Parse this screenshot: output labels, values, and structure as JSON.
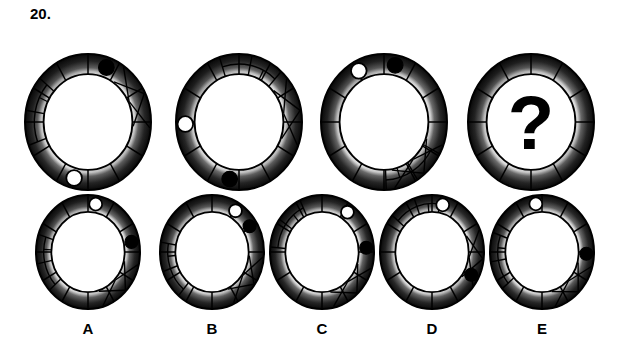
{
  "question": {
    "number": "20.",
    "type": "abstract-reasoning-matrix",
    "missing_marker": "?"
  },
  "palette": {
    "background": "#ffffff",
    "ink": "#000000",
    "ring_dark": "#0b0b0b",
    "ring_mid": "#6e6e6e",
    "ring_light": "#f2f2f2",
    "dot_black": "#000000",
    "dot_white": "#ffffff"
  },
  "sequence": {
    "label": "top-row-sequence",
    "items": [
      {
        "id": "seq-1",
        "position": 1,
        "spokes": 12,
        "black_dot_deg": -70,
        "white_dot_deg": 105,
        "zigzag_deg": -40,
        "ladder_deg": 190,
        "has_question": false,
        "cx": 88,
        "cy": 100,
        "rx": 63,
        "ry": 68
      },
      {
        "id": "seq-2",
        "position": 2,
        "spokes": 12,
        "black_dot_deg": 100,
        "white_dot_deg": 178,
        "zigzag_deg": -25,
        "ladder_deg": -78,
        "has_question": false,
        "cx": 239,
        "cy": 100,
        "rx": 63,
        "ry": 68
      },
      {
        "id": "seq-3",
        "position": 3,
        "spokes": 12,
        "black_dot_deg": -78,
        "white_dot_deg": -118,
        "zigzag_deg": 35,
        "ladder_deg": 58,
        "has_question": false,
        "cx": 384,
        "cy": 100,
        "rx": 63,
        "ry": 68
      },
      {
        "id": "seq-4",
        "position": 4,
        "spokes": 12,
        "black_dot_deg": null,
        "white_dot_deg": null,
        "zigzag_deg": null,
        "ladder_deg": null,
        "has_question": true,
        "cx": 531,
        "cy": 100,
        "rx": 63,
        "ry": 68
      }
    ]
  },
  "options": {
    "label": "answer-options",
    "items": [
      {
        "id": "option-a",
        "letter": "A",
        "spokes": 12,
        "black_dot_deg": -12,
        "white_dot_deg": -80,
        "zigzag_deg": 28,
        "ladder_deg": 168,
        "has_question": false,
        "cx": 88,
        "cy": 62,
        "rx": 52,
        "ry": 57,
        "label_x": 88,
        "label_y": 130
      },
      {
        "id": "option-b",
        "letter": "B",
        "spokes": 12,
        "black_dot_deg": -32,
        "white_dot_deg": -58,
        "zigzag_deg": 20,
        "ladder_deg": 160,
        "has_question": false,
        "cx": 212,
        "cy": 62,
        "rx": 52,
        "ry": 57,
        "label_x": 212,
        "label_y": 130
      },
      {
        "id": "option-c",
        "letter": "C",
        "spokes": 12,
        "black_dot_deg": -5,
        "white_dot_deg": -55,
        "zigzag_deg": 32,
        "ladder_deg": -145,
        "has_question": false,
        "cx": 322,
        "cy": 62,
        "rx": 52,
        "ry": 57,
        "label_x": 322,
        "label_y": 130
      },
      {
        "id": "option-d",
        "letter": "D",
        "spokes": 12,
        "black_dot_deg": 28,
        "white_dot_deg": -76,
        "zigzag_deg": -8,
        "ladder_deg": -110,
        "has_question": false,
        "cx": 432,
        "cy": 62,
        "rx": 52,
        "ry": 57,
        "label_x": 432,
        "label_y": 130
      },
      {
        "id": "option-e",
        "letter": "E",
        "spokes": 12,
        "black_dot_deg": 2,
        "white_dot_deg": -98,
        "zigzag_deg": 30,
        "ladder_deg": 170,
        "has_question": false,
        "cx": 542,
        "cy": 62,
        "rx": 52,
        "ry": 57,
        "label_x": 542,
        "label_y": 130
      }
    ]
  }
}
